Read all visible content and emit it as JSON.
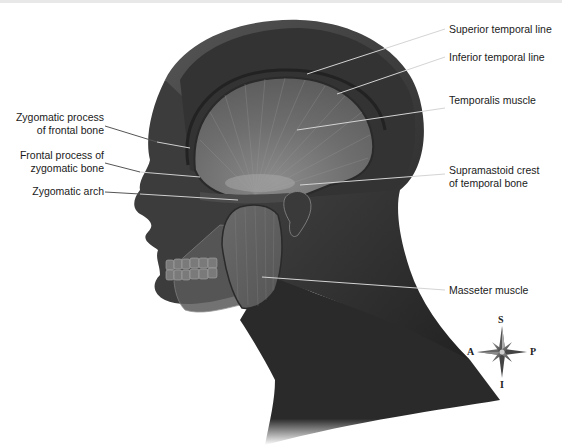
{
  "figure": {
    "labels_left": [
      {
        "id": "zygomatic-process-frontal",
        "lines": [
          "Zygomatic process",
          "of frontal bone"
        ]
      },
      {
        "id": "frontal-process-zygomatic",
        "lines": [
          "Frontal process of",
          "zygomatic bone"
        ]
      },
      {
        "id": "zygomatic-arch",
        "lines": [
          "Zygomatic arch"
        ]
      }
    ],
    "labels_right": [
      {
        "id": "superior-temporal-line",
        "lines": [
          "Superior temporal line"
        ]
      },
      {
        "id": "inferior-temporal-line",
        "lines": [
          "Inferior temporal line"
        ]
      },
      {
        "id": "temporalis-muscle",
        "lines": [
          "Temporalis muscle"
        ]
      },
      {
        "id": "supramastoid-crest",
        "lines": [
          "Supramastoid crest",
          "of temporal bone"
        ]
      },
      {
        "id": "masseter-muscle",
        "lines": [
          "Masseter muscle"
        ]
      }
    ]
  },
  "compass": {
    "top": "S",
    "bottom": "I",
    "left": "A",
    "right": "P"
  },
  "colors": {
    "skin_dark": "#2e2e2e",
    "muscle_gray": "#6a6a6a",
    "leader_line": "#cfcfcf",
    "label_text": "#1a1a1a"
  }
}
